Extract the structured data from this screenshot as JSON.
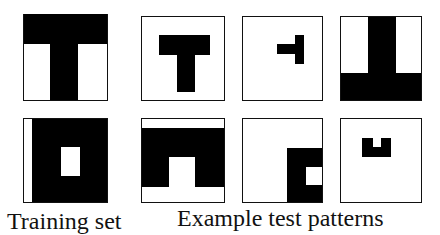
{
  "figure": {
    "colors": {
      "foreground": "#000000",
      "background": "#ffffff"
    },
    "training_set": {
      "label": "Training set",
      "patterns": [
        {
          "name": "T shape (full size, upright)"
        },
        {
          "name": "Rotated T / H-like shape with notch on right"
        }
      ]
    },
    "test_patterns": {
      "label": "Example test patterns",
      "patterns": [
        {
          "name": "Small centered T"
        },
        {
          "name": "Tiny rotated T, upper right"
        },
        {
          "name": "Inverted T (upside down)"
        },
        {
          "name": "Arch / inverted U shape"
        },
        {
          "name": "Small block with square hole, lower right"
        },
        {
          "name": "Tiny U shape, upper center"
        }
      ]
    }
  }
}
